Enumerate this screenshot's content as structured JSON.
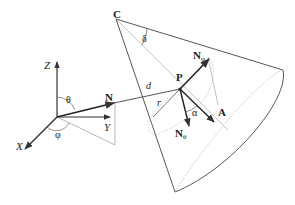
{
  "figure": {
    "colors": {
      "line": "#444444",
      "thin_line": "#888888",
      "dotted_line": "#aaaaaa",
      "text": "#222222"
    },
    "axes": {
      "z_label": "Z",
      "y_label": "Y",
      "x_label": "X"
    },
    "angles": {
      "theta": "θ",
      "phi": "φ",
      "delta": "δ",
      "alpha": "α"
    },
    "points": {
      "apex": "C",
      "point": "P"
    },
    "vectors": {
      "normal": "N",
      "n_phi_base": "N",
      "n_phi_sub": "φ",
      "n_theta_base": "N",
      "n_theta_sub": "θ",
      "axis": "A"
    },
    "lengths": {
      "distance": "d",
      "radius": "r"
    }
  }
}
